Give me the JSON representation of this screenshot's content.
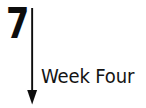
{
  "canvas": {
    "width": 146,
    "height": 108,
    "background_color": "#ffffff"
  },
  "annotation": {
    "step_number": "7",
    "caption": "Week Four",
    "ink_color": "#0d0d0d",
    "caption_color": "#141414",
    "arrow_icon_name": "downward-arrow-icon",
    "arrow": {
      "direction": "down",
      "shaft_top_y": 4,
      "shaft_bottom_y": 86,
      "shaft_x": 9,
      "shaft_width": 2,
      "head_half_width": 5,
      "head_height": 14
    }
  }
}
